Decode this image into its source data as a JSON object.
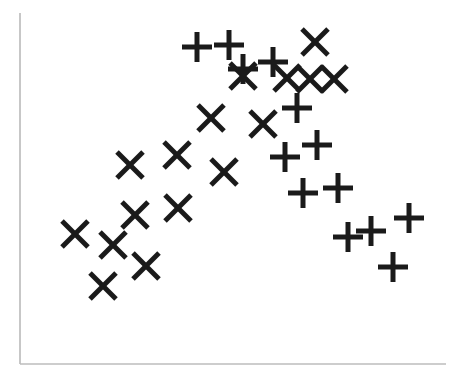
{
  "figure": {
    "width": 458,
    "height": 381,
    "background_color": "#ffffff",
    "marker_color": "#1a1a1a",
    "axis_color": "#b8b8b8"
  },
  "axes": {
    "left_spine": {
      "x": 20,
      "y_top": 13,
      "y_bottom": 364,
      "width": 1.6,
      "color": "#b9b9b9"
    },
    "bottom_spine": {
      "y": 364,
      "x_left": 20,
      "x_right": 446,
      "width": 1.6,
      "color": "#bcbcbc"
    },
    "top_spine_visible": false,
    "right_spine_visible": false,
    "tick_labels_visible": false,
    "gridlines_visible": false
  },
  "chart_data": {
    "type": "scatter",
    "title": "",
    "xlabel": "",
    "ylabel": "",
    "xlim": [
      20,
      446
    ],
    "ylim": [
      13,
      364
    ],
    "grid": false,
    "legend_visible": false,
    "axis_ticks": false,
    "marker_size_px": 26,
    "marker_stroke_px": 5,
    "series": [
      {
        "name": "x-marker-series",
        "marker": "x",
        "marker_symbol": "✕",
        "color": "#1a1a1a",
        "count": 20,
        "points": [
          {
            "x": 315,
            "y": 42
          },
          {
            "x": 243,
            "y": 76
          },
          {
            "x": 287,
            "y": 78
          },
          {
            "x": 310,
            "y": 79
          },
          {
            "x": 334,
            "y": 79
          },
          {
            "x": 211,
            "y": 118
          },
          {
            "x": 263,
            "y": 124
          },
          {
            "x": 130,
            "y": 165
          },
          {
            "x": 177,
            "y": 155
          },
          {
            "x": 224,
            "y": 172
          },
          {
            "x": 178,
            "y": 208
          },
          {
            "x": 135,
            "y": 215
          },
          {
            "x": 75,
            "y": 234
          },
          {
            "x": 113,
            "y": 245
          },
          {
            "x": 146,
            "y": 266
          },
          {
            "x": 103,
            "y": 286
          }
        ]
      },
      {
        "name": "plus-marker-series",
        "marker": "plus",
        "marker_symbol": "✚",
        "color": "#1a1a1a",
        "count": 19,
        "points": [
          {
            "x": 197,
            "y": 47
          },
          {
            "x": 229,
            "y": 45
          },
          {
            "x": 243,
            "y": 69
          },
          {
            "x": 273,
            "y": 62
          },
          {
            "x": 297,
            "y": 108
          },
          {
            "x": 317,
            "y": 145
          },
          {
            "x": 285,
            "y": 157
          },
          {
            "x": 303,
            "y": 193
          },
          {
            "x": 338,
            "y": 188
          },
          {
            "x": 348,
            "y": 237
          },
          {
            "x": 371,
            "y": 231
          },
          {
            "x": 409,
            "y": 218
          },
          {
            "x": 393,
            "y": 267
          }
        ]
      }
    ]
  }
}
